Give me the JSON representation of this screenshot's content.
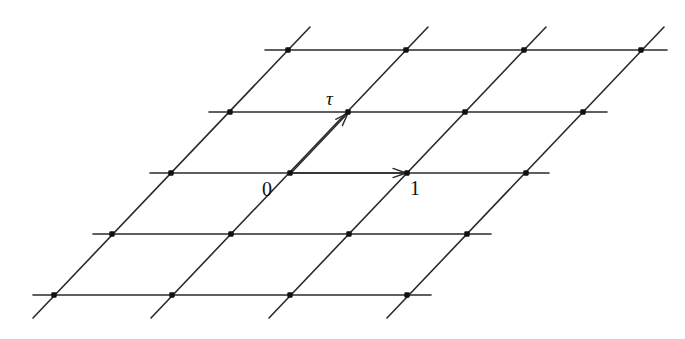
{
  "figure": {
    "kind": "lattice-diagram",
    "background_color": "#ffffff",
    "line_color": "#2b2b2b",
    "node_color": "#111111",
    "label_color": "#111111"
  },
  "labels": [
    {
      "id": "origin",
      "text": "0",
      "x": 262,
      "y": 179,
      "style": "number"
    },
    {
      "id": "one",
      "text": "1",
      "x": 410,
      "y": 178,
      "style": "number"
    },
    {
      "id": "tau",
      "text": "τ",
      "x": 326,
      "y": 89,
      "style": "greek"
    }
  ],
  "lattice": {
    "rows": 5,
    "columns": 4,
    "row_spacing_y": 60.8,
    "column_spacing_x": 118,
    "row_shift_x": -59,
    "origin": {
      "x": 290,
      "y": 173
    },
    "basis_one": {
      "dx": 118,
      "dy": 0
    },
    "basis_tau": {
      "dx": 59,
      "dy": -60.8
    },
    "horizontal_lines": [
      {
        "y": 50,
        "x_start": 265,
        "x_end": 667
      },
      {
        "y": 112,
        "x_start": 209,
        "x_end": 607
      },
      {
        "y": 173,
        "x_start": 150,
        "x_end": 549
      },
      {
        "y": 234,
        "x_start": 93,
        "x_end": 491
      },
      {
        "y": 295,
        "x_start": 33,
        "x_end": 431
      }
    ],
    "diagonal_lines": [
      {
        "x_top": 310,
        "y_top": 27,
        "x_bottom": 33,
        "y_bottom": 318
      },
      {
        "x_top": 428,
        "y_top": 27,
        "x_bottom": 151,
        "y_bottom": 318
      },
      {
        "x_top": 546,
        "y_top": 27,
        "x_bottom": 269,
        "y_bottom": 318
      },
      {
        "x_top": 664,
        "y_top": 27,
        "x_bottom": 387,
        "y_bottom": 318
      }
    ],
    "nodes": [
      {
        "x": 288,
        "y": 50
      },
      {
        "x": 406,
        "y": 50
      },
      {
        "x": 524,
        "y": 50
      },
      {
        "x": 641,
        "y": 50
      },
      {
        "x": 230,
        "y": 112
      },
      {
        "x": 348,
        "y": 112
      },
      {
        "x": 465,
        "y": 112
      },
      {
        "x": 583,
        "y": 112
      },
      {
        "x": 171,
        "y": 173
      },
      {
        "x": 290,
        "y": 173
      },
      {
        "x": 407,
        "y": 173
      },
      {
        "x": 526,
        "y": 173
      },
      {
        "x": 112,
        "y": 234
      },
      {
        "x": 231,
        "y": 234
      },
      {
        "x": 349,
        "y": 234
      },
      {
        "x": 467,
        "y": 234
      },
      {
        "x": 54,
        "y": 295
      },
      {
        "x": 172,
        "y": 295
      },
      {
        "x": 290,
        "y": 295
      },
      {
        "x": 407,
        "y": 295
      }
    ]
  },
  "vectors": [
    {
      "id": "vector-one",
      "label": "1",
      "from": {
        "x": 292,
        "y": 173
      },
      "to": {
        "x": 406,
        "y": 173
      },
      "arrowhead_at": {
        "x": 406,
        "y": 173
      }
    },
    {
      "id": "vector-tau",
      "label": "τ",
      "from": {
        "x": 292,
        "y": 172
      },
      "to": {
        "x": 348,
        "y": 113
      },
      "arrowhead_at": {
        "x": 348,
        "y": 113
      }
    }
  ]
}
